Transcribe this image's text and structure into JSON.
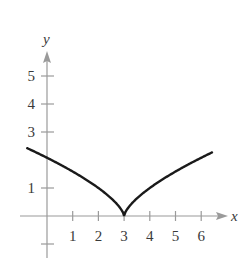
{
  "chart_data": {
    "type": "line",
    "title": "",
    "function": "y = (x - 3)^(2/3)",
    "xlabel": "x",
    "ylabel": "y",
    "xlim": [
      -0.8,
      6.4
    ],
    "ylim": [
      -1.5,
      5.6
    ],
    "grid": false,
    "legend": null,
    "x_ticks": [
      1,
      2,
      3,
      4,
      5,
      6
    ],
    "x_tick_labels": [
      "1",
      "2",
      "3",
      "4",
      "5",
      "6"
    ],
    "y_ticks": [
      -1,
      1,
      3,
      4,
      5
    ],
    "y_tick_labels": [
      "",
      "1",
      "3",
      "4",
      "5"
    ],
    "series": [
      {
        "name": "curve",
        "color": "#1a1a1a",
        "x": [
          -0.77,
          0,
          0.5,
          1,
          1.5,
          2,
          2.5,
          2.8,
          2.95,
          3,
          3.05,
          3.2,
          3.5,
          4,
          4.5,
          5,
          5.5,
          6,
          6.42
        ],
        "y": [
          2.42,
          2.08,
          1.84,
          1.59,
          1.31,
          1.0,
          0.63,
          0.34,
          0.14,
          0,
          0.14,
          0.34,
          0.63,
          1.0,
          1.31,
          1.59,
          1.84,
          2.08,
          2.27
        ]
      }
    ],
    "annotations": [
      {
        "type": "cusp",
        "x": 3,
        "y": 0
      }
    ]
  },
  "axes": {
    "x_label": "x",
    "y_label": "y",
    "axis_color": "#9a9a9a",
    "text_color": "#3a3a3a"
  }
}
